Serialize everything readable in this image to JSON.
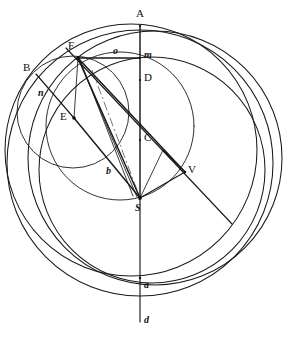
{
  "figure": {
    "background_color": "#ffffff",
    "ink_color": "#1a1a1a",
    "dash_color": "#6f6f6f",
    "width": 298,
    "height": 346
  },
  "labels": [
    {
      "id": "A",
      "text": "A",
      "case": "upper",
      "x": 136,
      "y": 8,
      "point_x": 140,
      "point_y": 26
    },
    {
      "id": "F",
      "text": "F",
      "case": "upper",
      "x": 68,
      "y": 40,
      "point_x": 78,
      "point_y": 58
    },
    {
      "id": "o",
      "text": "o",
      "case": "lower",
      "x": 113,
      "y": 46,
      "point_x": 113,
      "point_y": 58
    },
    {
      "id": "m",
      "text": "m",
      "case": "lower",
      "x": 144,
      "y": 50,
      "point_x": 140,
      "point_y": 58
    },
    {
      "id": "B",
      "text": "B",
      "case": "upper",
      "x": 23,
      "y": 62,
      "point_x": 36,
      "point_y": 74
    },
    {
      "id": "D",
      "text": "D",
      "case": "upper",
      "x": 144,
      "y": 72,
      "point_x": 140,
      "point_y": 80
    },
    {
      "id": "n",
      "text": "n",
      "case": "lower",
      "x": 38,
      "y": 88,
      "point_x": 50,
      "point_y": 98
    },
    {
      "id": "E",
      "text": "E",
      "case": "upper",
      "x": 60,
      "y": 111,
      "point_x": 74,
      "point_y": 118
    },
    {
      "id": "C",
      "text": "C",
      "case": "upper",
      "x": 144,
      "y": 132,
      "point_x": 140,
      "point_y": 140
    },
    {
      "id": "b",
      "text": "b",
      "case": "lower",
      "x": 106,
      "y": 166,
      "point_x": 112,
      "point_y": 176
    },
    {
      "id": "V",
      "text": "V",
      "case": "upper",
      "x": 188,
      "y": 164,
      "point_x": 184,
      "point_y": 172
    },
    {
      "id": "S",
      "text": "S",
      "case": "lower",
      "x": 135,
      "y": 203,
      "point_x": 140,
      "point_y": 198
    },
    {
      "id": "a",
      "text": "a",
      "case": "lower",
      "x": 144,
      "y": 280,
      "point_x": 140,
      "point_y": 278
    },
    {
      "id": "d",
      "text": "d",
      "case": "lower",
      "x": 144,
      "y": 315,
      "point_x": 140,
      "point_y": 322
    }
  ],
  "circles": [
    {
      "id": "outer-main-circle",
      "cx": 140,
      "cy": 163,
      "r": 133
    },
    {
      "id": "upper-large-circle",
      "cx": 131,
      "cy": 150,
      "r": 126
    },
    {
      "id": "right-large-circle",
      "cx": 155,
      "cy": 158,
      "r": 127
    },
    {
      "id": "mid-right-circle",
      "cx": 152,
      "cy": 170,
      "r": 113
    },
    {
      "id": "small-left-circle",
      "cx": 73,
      "cy": 112,
      "r": 56
    },
    {
      "id": "inner-upper-circle",
      "cx": 120,
      "cy": 126,
      "r": 74
    }
  ],
  "segments": [
    {
      "id": "vertical-axis-A-S",
      "x1": 140,
      "y1": 26,
      "x2": 140,
      "y2": 198,
      "weight": "heavy"
    },
    {
      "id": "vertical-axis-S-a",
      "x1": 140,
      "y1": 198,
      "x2": 140,
      "y2": 278,
      "weight": "normal"
    },
    {
      "id": "vertical-axis-a-d",
      "x1": 140,
      "y1": 278,
      "x2": 140,
      "y2": 322,
      "weight": "normal"
    },
    {
      "id": "horizontal-F-m",
      "x1": 78,
      "y1": 58,
      "x2": 140,
      "y2": 58,
      "weight": "heavy"
    },
    {
      "id": "chord-F-S",
      "x1": 78,
      "y1": 58,
      "x2": 140,
      "y2": 198,
      "weight": "heavy"
    },
    {
      "id": "chord-F-S-second",
      "x1": 78,
      "y1": 58,
      "x2": 137,
      "y2": 197,
      "weight": "light"
    },
    {
      "id": "chord-F-S-third",
      "x1": 80,
      "y1": 60,
      "x2": 133,
      "y2": 196,
      "weight": "light"
    },
    {
      "id": "chord-F-V",
      "x1": 78,
      "y1": 58,
      "x2": 185,
      "y2": 172,
      "weight": "heavy"
    },
    {
      "id": "chord-F-E",
      "x1": 78,
      "y1": 58,
      "x2": 74,
      "y2": 118,
      "weight": "light"
    },
    {
      "id": "chord-E-S",
      "x1": 74,
      "y1": 118,
      "x2": 140,
      "y2": 198,
      "weight": "heavy"
    },
    {
      "id": "chord-B-E",
      "x1": 36,
      "y1": 74,
      "x2": 74,
      "y2": 118,
      "weight": "normal"
    },
    {
      "id": "diagonal-F-through-V",
      "x1": 66,
      "y1": 48,
      "x2": 232,
      "y2": 224,
      "weight": "normal"
    },
    {
      "id": "square-S-V-leg1",
      "x1": 140,
      "y1": 198,
      "x2": 185,
      "y2": 172,
      "weight": "normal"
    },
    {
      "id": "square-S-V-leg2",
      "x1": 163,
      "y1": 150,
      "x2": 185,
      "y2": 172,
      "weight": "normal"
    },
    {
      "id": "right-angle-marker",
      "x1": 140,
      "y1": 198,
      "x2": 163,
      "y2": 150,
      "weight": "light"
    }
  ],
  "dashed_segments": [
    {
      "id": "dash-chord-F-a",
      "x1": 92,
      "y1": 70,
      "x2": 140,
      "y2": 198
    }
  ],
  "vertex_points": [
    {
      "id": "point-A",
      "x": 140,
      "y": 26,
      "r": 1.1
    },
    {
      "id": "point-F",
      "x": 78,
      "y": 58,
      "r": 1.9
    },
    {
      "id": "point-m",
      "x": 140,
      "y": 58,
      "r": 1.1
    },
    {
      "id": "point-D",
      "x": 140,
      "y": 80,
      "r": 1.0
    },
    {
      "id": "point-E",
      "x": 74,
      "y": 118,
      "r": 1.8
    },
    {
      "id": "point-C",
      "x": 140,
      "y": 140,
      "r": 1.0
    },
    {
      "id": "point-V",
      "x": 185,
      "y": 172,
      "r": 1.2
    },
    {
      "id": "point-S",
      "x": 140,
      "y": 198,
      "r": 1.9
    },
    {
      "id": "point-a",
      "x": 140,
      "y": 278,
      "r": 1.2
    }
  ]
}
